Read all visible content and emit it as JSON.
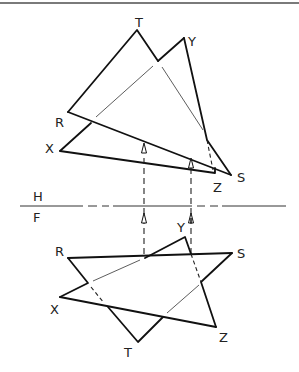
{
  "diagram": {
    "type": "orthographic-projection",
    "fold_line": {
      "upper_label": "H",
      "lower_label": "F"
    },
    "top_view": {
      "labels": {
        "T": "T",
        "Y": "Y",
        "R": "R",
        "X": "X",
        "S": "S",
        "Z": "Z"
      }
    },
    "front_view": {
      "labels": {
        "R": "R",
        "S": "S",
        "Y": "Y",
        "X": "X",
        "T": "T",
        "Z": "Z"
      }
    },
    "colors": {
      "line": "#111111",
      "background": "#ffffff",
      "border": "#7a7a7a"
    }
  }
}
